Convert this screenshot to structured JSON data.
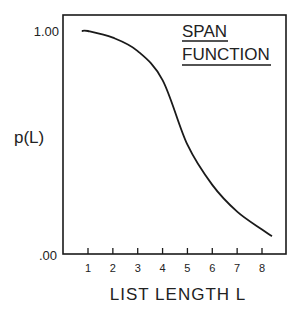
{
  "chart_data": {
    "type": "line",
    "title": "SPAN FUNCTION",
    "xlabel": "LIST LENGTH L",
    "ylabel": "p(L)",
    "x_ticks": [
      1,
      2,
      3,
      4,
      5,
      6,
      7,
      8
    ],
    "x_tick_labels": [
      "1",
      "2",
      "3",
      "4",
      "5",
      "6",
      "7",
      "8"
    ],
    "y_tick_labels": [
      "1.00",
      ".00"
    ],
    "ylim": [
      0,
      1.0
    ],
    "xlim": [
      0,
      9
    ],
    "grid": false,
    "series": [
      {
        "name": "span function",
        "x": [
          0.75,
          1,
          2,
          3,
          4,
          5,
          6,
          7,
          8,
          8.4
        ],
        "y": [
          1.0,
          1.0,
          0.97,
          0.91,
          0.78,
          0.49,
          0.31,
          0.19,
          0.11,
          0.08
        ]
      }
    ]
  },
  "labels": {
    "title_line1": "SPAN",
    "title_line2": "FUNCTION",
    "y_axis": "p(L)",
    "x_axis": "LIST LENGTH L",
    "y_top": "1.00",
    "y_bottom": ".00"
  }
}
